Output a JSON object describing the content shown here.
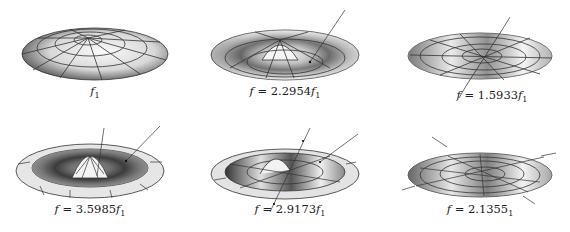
{
  "figure": {
    "panels": [
      {
        "id": "mode-1",
        "caption_prefix": "",
        "caption_value": "",
        "caption_var": "f",
        "caption_sub": "1",
        "mode": "fundamental",
        "arrows": 0
      },
      {
        "id": "mode-2",
        "caption_prefix": "f = ",
        "caption_value": "2.2954",
        "caption_var": "f",
        "caption_sub": "1",
        "mode": "axisymmetric-ring",
        "arrows": 1
      },
      {
        "id": "mode-3",
        "caption_prefix": "f = ",
        "caption_value": "1.5933",
        "caption_var": "f",
        "caption_sub": "1",
        "mode": "one-nodal-diameter",
        "arrows": 2
      },
      {
        "id": "mode-4",
        "caption_prefix": "f = ",
        "caption_value": "3.5985",
        "caption_var": "f",
        "caption_sub": "1",
        "mode": "axisymmetric-two-rings",
        "arrows": 2
      },
      {
        "id": "mode-5",
        "caption_prefix": "f = ",
        "caption_value": "2.9173",
        "caption_var": "f",
        "caption_sub": "1",
        "mode": "diameter-plus-ring",
        "arrows": 3
      },
      {
        "id": "mode-6",
        "caption_prefix": "f = ",
        "caption_value": "2.1355",
        "caption_var": "",
        "caption_sub": "1",
        "mode": "two-nodal-diameters",
        "arrows": 4
      }
    ]
  }
}
